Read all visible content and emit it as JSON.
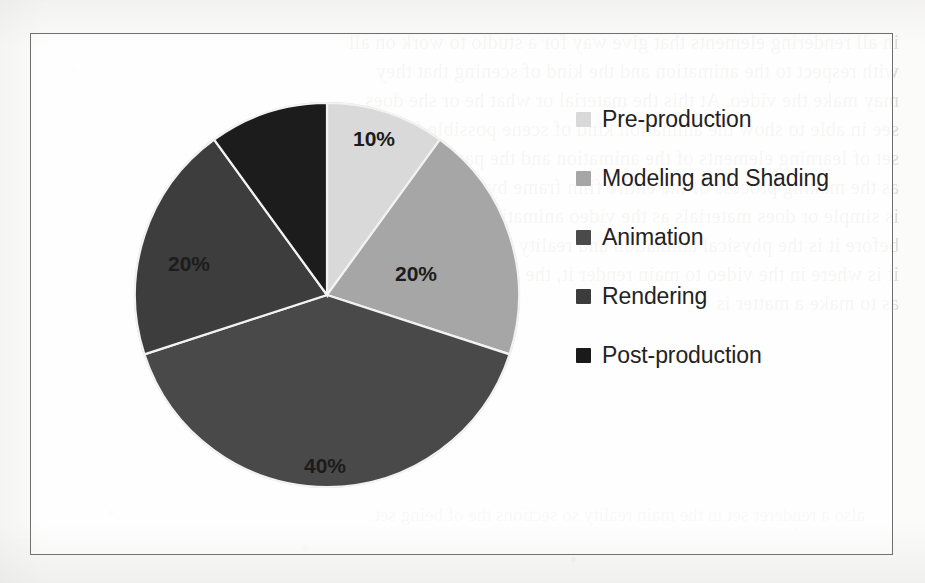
{
  "figure": {
    "kind": "scanned-book-figure",
    "frame_border_color": "#6e6e6e",
    "page_background_color": "#fbfbfa"
  },
  "bleed_through": {
    "note": "faint mirrored show-through text from the reverse of the scanned page",
    "lines": [
      "in all rendering elements that give way for a studio to work on all",
      "with respect to the animation and the kind of scening that they",
      "may make the video. At this the material or what he or she does",
      "see in able to show the animation kind of scene possible for what",
      "set of learning elements of the animation and the parts not rather",
      "as the making process of the entire film frame by frame improving",
      "is simple or does materials as the video animation being material",
      "before it is the physical animation and reality to build in to set of",
      "it is where in the video to main render it, the render in the a few",
      "as to make a matter is"
    ],
    "lower_lines": [
      "also a renderer set in the main reality so sections",
      "the of being set"
    ]
  },
  "chart_data": {
    "type": "pie",
    "title": "",
    "start_angle_deg": 0,
    "direction": "clockwise",
    "labels_inside_slices": true,
    "legend_position": "right",
    "categories": [
      "Pre-production",
      "Modeling and Shading",
      "Animation",
      "Rendering",
      "Post-production"
    ],
    "values": [
      10,
      20,
      40,
      20,
      10
    ],
    "value_labels": [
      "10%",
      "20%",
      "40%",
      "20%",
      ""
    ],
    "colors": [
      "#d9d9d9",
      "#a6a6a6",
      "#4a4a4a",
      "#3c3c3c",
      "#1a1a1a"
    ],
    "slice_separator_color": "#f2f2f2",
    "xlabel": "",
    "ylabel": ""
  },
  "legend": {
    "items": [
      {
        "label": "Pre-production",
        "color": "#d9d9d9"
      },
      {
        "label": "Modeling and Shading",
        "color": "#a6a6a6"
      },
      {
        "label": "Animation",
        "color": "#4a4a4a"
      },
      {
        "label": "Rendering",
        "color": "#3c3c3c"
      },
      {
        "label": "Post-production",
        "color": "#1a1a1a"
      }
    ]
  },
  "slice_labels": {
    "pre_production": "10%",
    "modeling_and_shading": "20%",
    "animation": "40%",
    "rendering": "20%"
  }
}
